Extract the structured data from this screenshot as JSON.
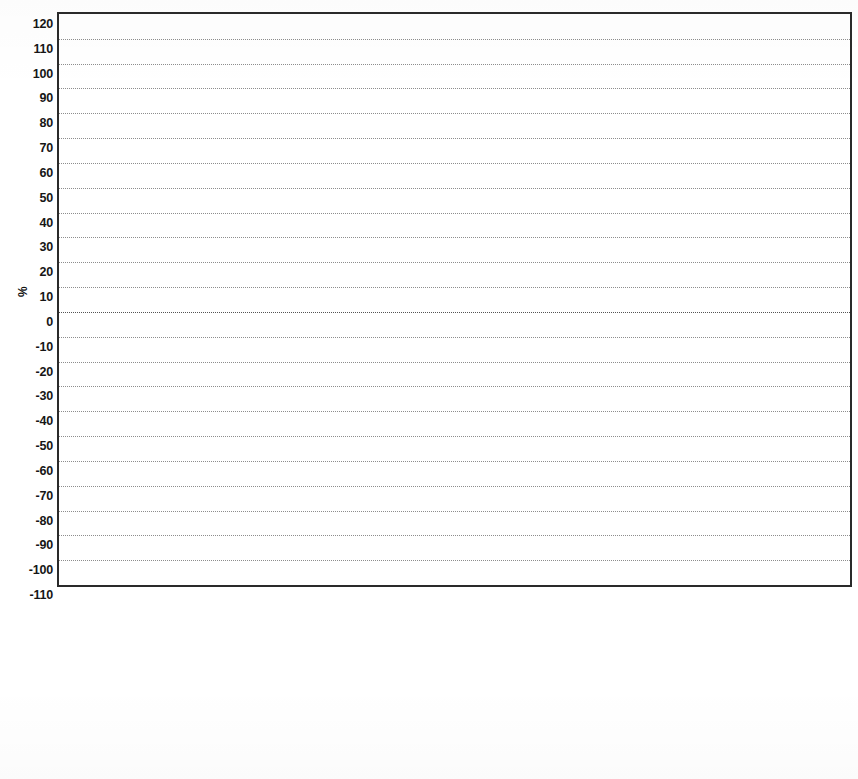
{
  "chart_data": {
    "type": "bar",
    "subtype": "stacked-bar-percentage",
    "title": "",
    "xlabel": "",
    "ylabel": "%",
    "ylim": [
      -110,
      120
    ],
    "ytick_step": 10,
    "yticks": [
      120,
      110,
      100,
      90,
      80,
      70,
      60,
      50,
      40,
      30,
      20,
      10,
      0,
      -10,
      -20,
      -30,
      -40,
      -50,
      -60,
      -70,
      -80,
      -90,
      -100,
      -110
    ],
    "ytick_labels": [
      "120",
      "110",
      "100",
      "90",
      "80",
      "70",
      "60",
      "50",
      "40",
      "30",
      "20",
      "10",
      "0",
      "-10",
      "-20",
      "-30",
      "-40",
      "-50",
      "-60",
      "-70",
      "-80",
      "-90",
      "-100",
      "-110"
    ],
    "grid": true,
    "grid_axis": "both",
    "legend_position": "bottom",
    "categories": [
      "Abiotic depletion",
      "Acidification",
      "Eutrophication",
      "Global warming (GWP100)",
      "Ozone layer depletion (OD",
      "Human toxicity",
      "Fresh water aquatic ecoto",
      "Marine aquatic ecotoxicity",
      "Terrestrial ecotoxicity",
      "Photochemical oxidation"
    ],
    "category_lines": [
      [
        "Abiotic",
        "depletion"
      ],
      [
        "Acidification",
        ""
      ],
      [
        "Eutrophication",
        ""
      ],
      [
        "Global warming",
        "(GWP100)"
      ],
      [
        "Ozone layer",
        "depletion (OD"
      ],
      [
        "Human toxicity",
        ""
      ],
      [
        "Fresh water",
        "aquatic ecoto"
      ],
      [
        "Marine aquatic",
        "ecotoxicity"
      ],
      [
        "Terrestrial",
        "ecotoxicity"
      ],
      [
        "Photochemical",
        "oxidation"
      ]
    ],
    "series": [
      {
        "name": "Farmed tree 1",
        "color": "#7b3d26",
        "values": [
          0.8,
          4.2,
          5.0,
          98.0,
          0.8,
          36.0,
          11.0,
          2.0,
          41.0,
          69.0
        ]
      },
      {
        "name": "Farmed tree 2",
        "color": "#f2ed2c",
        "values": [
          9.8,
          34.8,
          44.0,
          4.5,
          15.0,
          33.0,
          35.0,
          40.0,
          13.0,
          14.0
        ]
      },
      {
        "name": "Starch",
        "color": "#7d7d7d",
        "values": [
          0.6,
          7.0,
          15.0,
          0.5,
          2.5,
          0.6,
          0.5,
          0.4,
          0.5,
          0.8
        ]
      },
      {
        "name": "Clay",
        "color": "#4a4a8f",
        "values": [
          0.5,
          6.0,
          1.5,
          2.5,
          62.0,
          6.0,
          0.4,
          0.6,
          12.0,
          0.6
        ]
      },
      {
        "name": "Aluminium sulphate",
        "color": "#3f7d7b",
        "values": [
          0.7,
          8.0,
          1.0,
          0.5,
          5.0,
          5.0,
          28.0,
          22.0,
          1.0,
          3.0
        ]
      },
      {
        "name": "OBA",
        "color": "#c262b4",
        "values": [
          0.5,
          0.5,
          0.5,
          0.5,
          1.5,
          0.5,
          2.0,
          2.0,
          0.5,
          0.5
        ]
      },
      {
        "name": "Chlorine",
        "color": "#3a2f5e",
        "values": [
          0.6,
          0.6,
          1.0,
          2.0,
          0.5,
          2.0,
          7.0,
          10.0,
          1.5,
          1.5
        ]
      },
      {
        "name": "NaOH",
        "color": "#7a3b24",
        "values": [
          1.0,
          5.0,
          2.5,
          0.8,
          14.0,
          3.0,
          3.0,
          6.0,
          7.0,
          2.0
        ]
      },
      {
        "name": "Rosin size",
        "color": "#6fc23a",
        "values": [
          0.4,
          0.5,
          0.5,
          0.4,
          0.5,
          0.5,
          7.0,
          1.0,
          19.0,
          1.0
        ]
      },
      {
        "name": "Electricity",
        "color": "#6b6b24",
        "values": [
          1.2,
          1.4,
          1.5,
          2.3,
          0.7,
          2.4,
          0.6,
          0.5,
          0.5,
          2.0
        ]
      },
      {
        "name": "Heavy fuel oil",
        "color": "#9b4fa8",
        "values": [
          83.9,
          32.0,
          27.5,
          18.0,
          3.0,
          11.0,
          5.5,
          15.5,
          4.0,
          5.6
        ]
      }
    ],
    "negative_bars": [
      {
        "category": "Global warming (GWP100)",
        "note": "Farmed tree 1 and Farmed tree 2 extend below zero",
        "min": -97
      }
    ]
  },
  "legend": {
    "left_column": [
      {
        "label": "Farmed tree 2",
        "color": "#f2ed2c"
      },
      {
        "label": "Starch",
        "color": "#7d7d7d"
      },
      {
        "label": "Aluminium sulphate",
        "color": "#3f7d7b"
      },
      {
        "label": "NaOH",
        "color": "#7a3b24"
      },
      {
        "label": "Electricity",
        "color": "#6b6b24"
      }
    ],
    "right_column": [
      {
        "label": "Farmed tree 1",
        "color": "#7b3d26"
      },
      {
        "label": "Clay",
        "color": "#4a4a8f"
      },
      {
        "label": "OBA",
        "color": "#c262b4"
      },
      {
        "label": "Chlorine",
        "color": "#3a2f5e"
      },
      {
        "label": "Rosin size",
        "color": "#6fc23a"
      },
      {
        "label": "Heavy fuel oil",
        "color": "#9b4fa8"
      }
    ]
  },
  "axis": {
    "y_title": "%"
  },
  "bar_stacks": [
    {
      "category": "Abiotic depletion",
      "segments": [
        {
          "name": "Farmed tree 1",
          "color": "#7b3d26",
          "from": 0.0,
          "to": 0.8
        },
        {
          "name": "Farmed tree 2",
          "color": "#f2ed2c",
          "from": 0.8,
          "to": 10.6
        },
        {
          "name": "Starch",
          "color": "#7d7d7d",
          "from": 10.6,
          "to": 11.2
        },
        {
          "name": "Clay",
          "color": "#4a4a8f",
          "from": 11.2,
          "to": 11.7
        },
        {
          "name": "Aluminium sulphate",
          "color": "#3f7d7b",
          "from": 11.7,
          "to": 12.4
        },
        {
          "name": "OBA",
          "color": "#c262b4",
          "from": 12.4,
          "to": 12.9
        },
        {
          "name": "Chlorine",
          "color": "#3a2f5e",
          "from": 12.9,
          "to": 13.5
        },
        {
          "name": "NaOH",
          "color": "#7a3b24",
          "from": 13.5,
          "to": 14.5
        },
        {
          "name": "Rosin size",
          "color": "#6fc23a",
          "from": 14.5,
          "to": 14.9
        },
        {
          "name": "Electricity",
          "color": "#6b6b24",
          "from": 14.9,
          "to": 16.1
        },
        {
          "name": "Heavy fuel oil",
          "color": "#9b4fa8",
          "from": 16.1,
          "to": 100.0
        }
      ]
    },
    {
      "category": "Acidification",
      "segments": [
        {
          "name": "Farmed tree 1",
          "color": "#7b3d26",
          "from": 0.0,
          "to": 4.2
        },
        {
          "name": "Farmed tree 2",
          "color": "#f2ed2c",
          "from": 4.2,
          "to": 39.0
        },
        {
          "name": "Starch",
          "color": "#7d7d7d",
          "from": 39.0,
          "to": 46.0
        },
        {
          "name": "Electricity",
          "color": "#6b6b24",
          "from": 46.0,
          "to": 47.4
        },
        {
          "name": "Aluminium sulphate",
          "color": "#3f7d7b",
          "from": 47.4,
          "to": 55.4
        },
        {
          "name": "OBA",
          "color": "#c262b4",
          "from": 55.4,
          "to": 55.9
        },
        {
          "name": "Clay",
          "color": "#4a4a8f",
          "from": 55.9,
          "to": 61.9
        },
        {
          "name": "Chlorine",
          "color": "#3a2f5e",
          "from": 61.9,
          "to": 62.5
        },
        {
          "name": "NaOH",
          "color": "#7a3b24",
          "from": 62.5,
          "to": 67.5
        },
        {
          "name": "Rosin size",
          "color": "#6fc23a",
          "from": 67.5,
          "to": 68.0
        },
        {
          "name": "Heavy fuel oil",
          "color": "#9b4fa8",
          "from": 68.0,
          "to": 100.0
        }
      ]
    },
    {
      "category": "Eutrophication",
      "segments": [
        {
          "name": "Farmed tree 1",
          "color": "#7b3d26",
          "from": 0.0,
          "to": 5.0
        },
        {
          "name": "Farmed tree 2",
          "color": "#f2ed2c",
          "from": 5.0,
          "to": 49.0
        },
        {
          "name": "Starch",
          "color": "#7d7d7d",
          "from": 49.0,
          "to": 64.0
        },
        {
          "name": "Aluminium sulphate",
          "color": "#3f7d7b",
          "from": 64.0,
          "to": 65.0
        },
        {
          "name": "OBA",
          "color": "#c262b4",
          "from": 65.0,
          "to": 65.5
        },
        {
          "name": "Clay",
          "color": "#4a4a8f",
          "from": 65.5,
          "to": 67.0
        },
        {
          "name": "Chlorine",
          "color": "#3a2f5e",
          "from": 67.0,
          "to": 68.0
        },
        {
          "name": "NaOH",
          "color": "#7a3b24",
          "from": 68.0,
          "to": 70.5
        },
        {
          "name": "Rosin size",
          "color": "#6fc23a",
          "from": 70.5,
          "to": 71.0
        },
        {
          "name": "Electricity",
          "color": "#6b6b24",
          "from": 71.0,
          "to": 72.5
        },
        {
          "name": "Heavy fuel oil",
          "color": "#9b4fa8",
          "from": 72.5,
          "to": 100.0
        }
      ]
    },
    {
      "category": "Global warming (GWP100)",
      "segments": [
        {
          "name": "Farmed tree 2",
          "color": "#f2ed2c",
          "from": -97.0,
          "to": -92.5
        },
        {
          "name": "Farmed tree 1",
          "color": "#7b3d26",
          "from": -92.5,
          "to": 5.5
        },
        {
          "name": "Starch",
          "color": "#7d7d7d",
          "from": 5.5,
          "to": 6.0
        },
        {
          "name": "Electricity",
          "color": "#6b6b24",
          "from": 6.0,
          "to": 8.3
        },
        {
          "name": "Clay",
          "color": "#4a4a8f",
          "from": 8.3,
          "to": 10.8
        },
        {
          "name": "NaOH",
          "color": "#7a3b24",
          "from": 10.8,
          "to": 11.6
        },
        {
          "name": "Chlorine",
          "color": "#3a2f5e",
          "from": 11.6,
          "to": 13.6
        },
        {
          "name": "OBA",
          "color": "#c262b4",
          "from": 13.6,
          "to": 14.1
        },
        {
          "name": "Rosin size",
          "color": "#6fc23a",
          "from": 14.1,
          "to": 14.5
        },
        {
          "name": "Heavy fuel oil",
          "color": "#9b4fa8",
          "from": 14.5,
          "to": 28.0
        }
      ]
    },
    {
      "category": "Ozone layer depletion (OD",
      "segments": [
        {
          "name": "Farmed tree 1",
          "color": "#7b3d26",
          "from": 0.0,
          "to": 0.8
        },
        {
          "name": "Farmed tree 2",
          "color": "#f2ed2c",
          "from": 0.8,
          "to": 15.8
        },
        {
          "name": "Starch",
          "color": "#7d7d7d",
          "from": 15.8,
          "to": 18.3
        },
        {
          "name": "OBA",
          "color": "#c262b4",
          "from": 18.3,
          "to": 19.8
        },
        {
          "name": "Electricity",
          "color": "#6b6b24",
          "from": 19.8,
          "to": 20.5
        },
        {
          "name": "Clay",
          "color": "#4a4a8f",
          "from": 20.5,
          "to": 82.5
        },
        {
          "name": "Aluminium sulphate",
          "color": "#3f7d7b",
          "from": 82.5,
          "to": 83.0
        },
        {
          "name": "NaOH",
          "color": "#7a3b24",
          "from": 83.0,
          "to": 97.0
        },
        {
          "name": "Heavy fuel oil",
          "color": "#9b4fa8",
          "from": 97.0,
          "to": 100.0
        }
      ]
    },
    {
      "category": "Human toxicity",
      "segments": [
        {
          "name": "Farmed tree 1",
          "color": "#7b3d26",
          "from": 0.0,
          "to": 36.0
        },
        {
          "name": "Farmed tree 2",
          "color": "#f2ed2c",
          "from": 36.0,
          "to": 69.0
        },
        {
          "name": "Electricity",
          "color": "#6b6b24",
          "from": 69.0,
          "to": 71.4
        },
        {
          "name": "Aluminium sulphate",
          "color": "#3f7d7b",
          "from": 71.4,
          "to": 76.4
        },
        {
          "name": "Chlorine",
          "color": "#3a2f5e",
          "from": 76.4,
          "to": 78.4
        },
        {
          "name": "Clay",
          "color": "#4a4a8f",
          "from": 78.4,
          "to": 84.4
        },
        {
          "name": "Starch",
          "color": "#7d7d7d",
          "from": 84.4,
          "to": 85.0
        },
        {
          "name": "NaOH",
          "color": "#7a3b24",
          "from": 85.0,
          "to": 88.0
        },
        {
          "name": "OBA",
          "color": "#c262b4",
          "from": 88.0,
          "to": 88.5
        },
        {
          "name": "Rosin size",
          "color": "#6fc23a",
          "from": 88.5,
          "to": 89.0
        },
        {
          "name": "Heavy fuel oil",
          "color": "#9b4fa8",
          "from": 89.0,
          "to": 100.0
        }
      ]
    },
    {
      "category": "Fresh water aquatic ecoto",
      "segments": [
        {
          "name": "Farmed tree 1",
          "color": "#7b3d26",
          "from": 0.0,
          "to": 11.0
        },
        {
          "name": "Farmed tree 2",
          "color": "#f2ed2c",
          "from": 11.0,
          "to": 46.0
        },
        {
          "name": "OBA",
          "color": "#c262b4",
          "from": 46.0,
          "to": 48.0
        },
        {
          "name": "Aluminium sulphate",
          "color": "#3f7d7b",
          "from": 48.0,
          "to": 76.0
        },
        {
          "name": "Chlorine",
          "color": "#3a2f5e",
          "from": 76.0,
          "to": 83.0
        },
        {
          "name": "NaOH",
          "color": "#7a3b24",
          "from": 83.0,
          "to": 86.0
        },
        {
          "name": "Starch",
          "color": "#7d7d7d",
          "from": 86.0,
          "to": 86.5
        },
        {
          "name": "Rosin size",
          "color": "#6fc23a",
          "from": 86.5,
          "to": 93.5
        },
        {
          "name": "Electricity",
          "color": "#6b6b24",
          "from": 93.5,
          "to": 94.1
        },
        {
          "name": "Heavy fuel oil",
          "color": "#9b4fa8",
          "from": 94.1,
          "to": 100.0
        }
      ]
    },
    {
      "category": "Marine aquatic ecotoxicity",
      "segments": [
        {
          "name": "Farmed tree 1",
          "color": "#7b3d26",
          "from": 0.0,
          "to": 2.0
        },
        {
          "name": "Farmed tree 2",
          "color": "#f2ed2c",
          "from": 2.0,
          "to": 42.0
        },
        {
          "name": "OBA",
          "color": "#c262b4",
          "from": 42.0,
          "to": 44.0
        },
        {
          "name": "Aluminium sulphate",
          "color": "#3f7d7b",
          "from": 44.0,
          "to": 66.0
        },
        {
          "name": "Chlorine",
          "color": "#3a2f5e",
          "from": 66.0,
          "to": 76.0
        },
        {
          "name": "NaOH",
          "color": "#7a3b24",
          "from": 76.0,
          "to": 82.0
        },
        {
          "name": "Electricity",
          "color": "#6b6b24",
          "from": 82.0,
          "to": 82.5
        },
        {
          "name": "Clay",
          "color": "#4a4a8f",
          "from": 82.5,
          "to": 83.1
        },
        {
          "name": "Rosin size",
          "color": "#6fc23a",
          "from": 83.1,
          "to": 84.1
        },
        {
          "name": "Starch",
          "color": "#7d7d7d",
          "from": 84.1,
          "to": 84.5
        },
        {
          "name": "Heavy fuel oil",
          "color": "#9b4fa8",
          "from": 84.5,
          "to": 100.0
        }
      ]
    },
    {
      "category": "Terrestrial ecotoxicity",
      "segments": [
        {
          "name": "Farmed tree 1",
          "color": "#7b3d26",
          "from": 0.0,
          "to": 41.0
        },
        {
          "name": "Farmed tree 2",
          "color": "#f2ed2c",
          "from": 41.0,
          "to": 54.0
        },
        {
          "name": "Aluminium sulphate",
          "color": "#3f7d7b",
          "from": 54.0,
          "to": 55.0
        },
        {
          "name": "Chlorine",
          "color": "#3a2f5e",
          "from": 55.0,
          "to": 56.5
        },
        {
          "name": "Clay",
          "color": "#4a4a8f",
          "from": 56.5,
          "to": 68.5
        },
        {
          "name": "NaOH",
          "color": "#7a3b24",
          "from": 68.5,
          "to": 75.5
        },
        {
          "name": "Rosin size",
          "color": "#6fc23a",
          "from": 75.5,
          "to": 94.5
        },
        {
          "name": "Electricity",
          "color": "#6b6b24",
          "from": 94.5,
          "to": 95.0
        },
        {
          "name": "Heavy fuel oil",
          "color": "#9b4fa8",
          "from": 95.0,
          "to": 100.0
        }
      ]
    },
    {
      "category": "Photochemical oxidation",
      "segments": [
        {
          "name": "Farmed tree 1",
          "color": "#7b3d26",
          "from": 0.0,
          "to": 69.5
        },
        {
          "name": "Farmed tree 2",
          "color": "#f2ed2c",
          "from": 69.5,
          "to": 83.5
        },
        {
          "name": "Electricity",
          "color": "#6b6b24",
          "from": 83.5,
          "to": 85.5
        },
        {
          "name": "Starch",
          "color": "#7d7d7d",
          "from": 85.5,
          "to": 86.3
        },
        {
          "name": "Aluminium sulphate",
          "color": "#3f7d7b",
          "from": 86.3,
          "to": 89.3
        },
        {
          "name": "Chlorine",
          "color": "#3a2f5e",
          "from": 89.3,
          "to": 90.8
        },
        {
          "name": "NaOH",
          "color": "#7a3b24",
          "from": 90.8,
          "to": 92.8
        },
        {
          "name": "OBA",
          "color": "#c262b4",
          "from": 92.8,
          "to": 93.3
        },
        {
          "name": "Clay",
          "color": "#4a4a8f",
          "from": 93.3,
          "to": 93.9
        },
        {
          "name": "Rosin size",
          "color": "#6fc23a",
          "from": 93.9,
          "to": 94.9
        },
        {
          "name": "Heavy fuel oil",
          "color": "#9b4fa8",
          "from": 94.9,
          "to": 100.0
        }
      ]
    }
  ]
}
